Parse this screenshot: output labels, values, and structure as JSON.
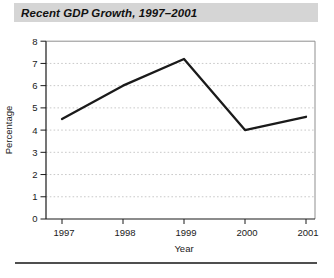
{
  "figure": {
    "title": "Recent GDP Growth, 1997–2001"
  },
  "chart_data": {
    "type": "line",
    "title": "Recent GDP Growth, 1997–2001",
    "categories": [
      "1997",
      "1998",
      "1999",
      "2000",
      "2001"
    ],
    "series": [
      {
        "name": "GDP growth",
        "values": [
          4.5,
          6.0,
          7.2,
          4.0,
          4.6
        ]
      }
    ],
    "xlabel": "Year",
    "ylabel": "Percentage",
    "ylim": [
      0,
      8
    ],
    "yticks": [
      0,
      1,
      2,
      3,
      4,
      5,
      6,
      7,
      8
    ],
    "grid": "horizontal dotted",
    "legend_position": "none"
  },
  "colors": {
    "background": "#ffffff",
    "title_bar_bg": "#d5d5d5",
    "title_text": "#111111",
    "axis": "#1a1a1a",
    "tick_label": "#1a1a1a",
    "grid": "#c9c9c9",
    "frame": "#8f8f8f",
    "line": "#1a1a1a",
    "rule": "#4f4f4f"
  }
}
